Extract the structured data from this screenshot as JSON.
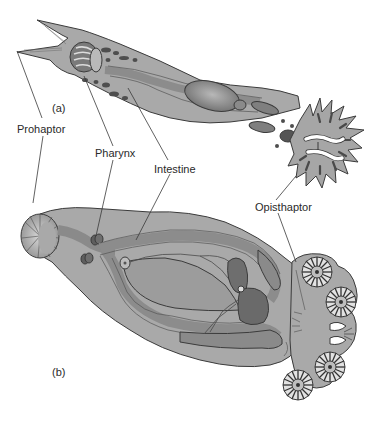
{
  "figure": {
    "panels": [
      {
        "id": "a",
        "label": "(a)"
      },
      {
        "id": "b",
        "label": "(b)"
      }
    ],
    "labels": {
      "prohaptor": "Prohaptor",
      "pharynx": "Pharynx",
      "intestine": "Intestine",
      "opisthaptor": "Opisthaptor"
    },
    "colors": {
      "body": "#a9a9a9",
      "body_light": "#c4c4c4",
      "organ": "#8a8a8a",
      "organ_dark": "#6e6e6e",
      "outline": "#3b3b3b",
      "background": "#ffffff"
    }
  }
}
